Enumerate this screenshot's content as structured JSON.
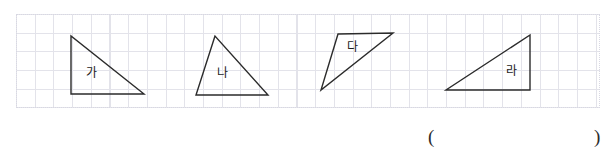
{
  "worksheet": {
    "grid": {
      "cell_size_px": 18.7,
      "columns": 31,
      "rows": 5,
      "line_color": "#e3e3ea",
      "border_color": "#d8d8e2",
      "background_color": "#ffffff"
    },
    "shape_stroke_color": "#2b2b2b",
    "shapes": [
      {
        "label": "가",
        "type": "right-triangle",
        "points": "71,36 71,94 144,94",
        "label_x": 91,
        "label_y": 73,
        "base_cells": 4,
        "height_cells": 3
      },
      {
        "label": "나",
        "type": "triangle",
        "points": "215,36 196,95 268,95",
        "label_x": 222,
        "label_y": 73,
        "base_cells": 4,
        "height_cells": 3
      },
      {
        "label": "다",
        "type": "triangle",
        "points": "338,34 393,33 321,90",
        "label_x": 352,
        "label_y": 47,
        "base_cells": 3,
        "height_cells": 3
      },
      {
        "label": "라",
        "type": "right-triangle",
        "points": "530,35 530,90 446,90",
        "label_x": 511,
        "label_y": 71,
        "base_cells": 4,
        "height_cells": 3
      }
    ],
    "answer_field": {
      "open_paren": "(",
      "close_paren": ")"
    }
  }
}
